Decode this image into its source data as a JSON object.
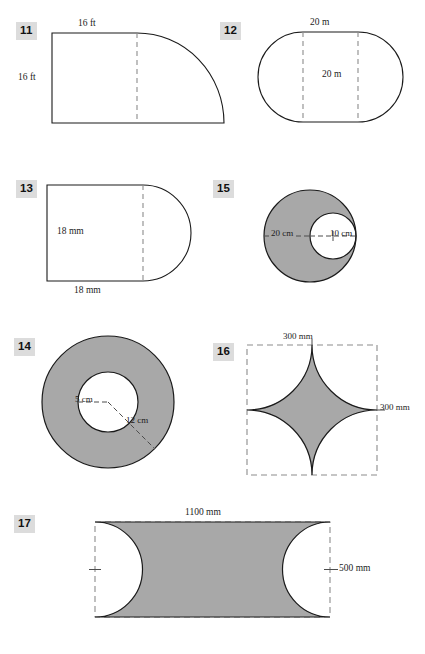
{
  "worksheet": {
    "title": "Composite Figures Worksheet",
    "page_background": "#ffffff",
    "shade_color": "#a8a8a8",
    "stroke_color": "#1a1a1a",
    "dash_color": "#8c8c8c",
    "badge_background": "#dcdcdc"
  },
  "figures": [
    {
      "number": "11",
      "name": "rectangle-with-quarter-circle",
      "shaded": false,
      "labels": [
        {
          "text": "16 ft",
          "role": "top-width"
        },
        {
          "text": "16 ft",
          "role": "left-height"
        }
      ]
    },
    {
      "number": "12",
      "name": "stadium-rectangle-with-two-semicircles",
      "shaded": false,
      "labels": [
        {
          "text": "20 m",
          "role": "top-width"
        },
        {
          "text": "20 m",
          "role": "inner-height"
        }
      ]
    },
    {
      "number": "13",
      "name": "square-with-semicircle",
      "shaded": false,
      "labels": [
        {
          "text": "18 mm",
          "role": "left-height"
        },
        {
          "text": "18 mm",
          "role": "bottom-width"
        }
      ]
    },
    {
      "number": "15",
      "name": "eccentric-annulus",
      "shaded": true,
      "labels": [
        {
          "text": "20 cm",
          "role": "outer-radius"
        },
        {
          "text": "10 cm",
          "role": "inner-radius"
        }
      ]
    },
    {
      "number": "14",
      "name": "concentric-annulus",
      "shaded": true,
      "labels": [
        {
          "text": "5 cm",
          "role": "inner-radius"
        },
        {
          "text": "12 cm",
          "role": "outer-radius"
        }
      ]
    },
    {
      "number": "16",
      "name": "astroid-star-in-square",
      "shaded": true,
      "labels": [
        {
          "text": "300 mm",
          "role": "top-width"
        },
        {
          "text": "300 mm",
          "role": "right-height"
        }
      ]
    },
    {
      "number": "17",
      "name": "rectangle-with-semicircles-removed",
      "shaded": true,
      "labels": [
        {
          "text": "1100 mm",
          "role": "top-width"
        },
        {
          "text": "500 mm",
          "role": "right-height"
        }
      ]
    }
  ]
}
